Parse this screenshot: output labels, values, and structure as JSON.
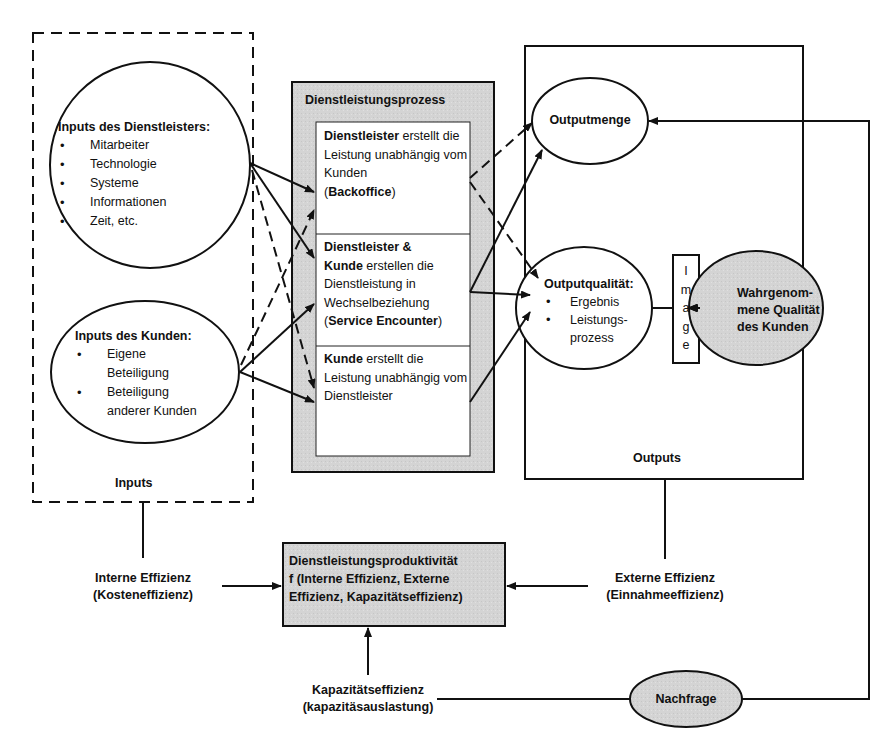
{
  "colors": {
    "line": "#111111",
    "shaded_fill": "#d6d6d6",
    "background": "#ffffff",
    "box_fill": "#ffffff"
  },
  "inputs": {
    "group_label": "Inputs",
    "provider": {
      "title": "Inputs des Dienstleisters:",
      "items": [
        "Mitarbeiter",
        "Technologie",
        "Systeme",
        "Informationen",
        "Zeit, etc."
      ]
    },
    "customer": {
      "title": "Inputs des Kunden:",
      "items": [
        "Eigene Beteiligung",
        "Beteiligung anderer Kunden"
      ],
      "item_lines": [
        [
          "Eigene",
          "Beteiligung"
        ],
        [
          "Beteiligung",
          "anderer Kunden"
        ]
      ]
    }
  },
  "process": {
    "title": "Dienstleistungsprozess",
    "cells": [
      {
        "bold_1": "Dienstleister",
        "text_1": " erstellt die Leistung unabhängig vom Kunden",
        "paren_open": "(",
        "bold_2": "Backoffice",
        "paren_close": ")"
      },
      {
        "bold_1": "Dienstleister &",
        "bold_2": "Kunde",
        "text_1": " erstellen die Dienstleistung in Wechselbeziehung",
        "paren_open": "(",
        "bold_3": "Service Encounter",
        "paren_close": ")"
      },
      {
        "bold_1": "Kunde",
        "text_1": " erstellt die Leistung unabhängig vom Dienstleister"
      }
    ]
  },
  "outputs": {
    "group_label": "Outputs",
    "quantity": {
      "title": "Outputmenge"
    },
    "quality": {
      "title": "Outputqualität:",
      "items": [
        "Ergebnis",
        "Leistungs-prozess"
      ],
      "item_lines": [
        [
          "Ergebnis"
        ],
        [
          "Leistungs-",
          "prozess"
        ]
      ]
    },
    "image_label": "Image",
    "image_letters": [
      "I",
      "m",
      "a",
      "g",
      "e"
    ],
    "perceived_quality": {
      "lines": [
        "Wahrgenom-",
        "mene Qualität",
        "des Kunden"
      ]
    }
  },
  "efficiency": {
    "internal": {
      "line1": "Interne Effizienz",
      "line2": "(Kosteneffizienz)"
    },
    "external": {
      "line1": "Externe Effizienz",
      "line2": "(Einnahmeeffizienz)"
    },
    "capacity": {
      "line1": "Kapazitätseffizienz",
      "line2": "(kapazitäsauslastung)"
    }
  },
  "productivity": {
    "lines": [
      "Dienstleistungsproduktivität",
      "f (Interne Effizienz, Externe",
      "Effizienz, Kapazitätseffizienz)"
    ]
  },
  "demand": {
    "label": "Nachfrage"
  }
}
